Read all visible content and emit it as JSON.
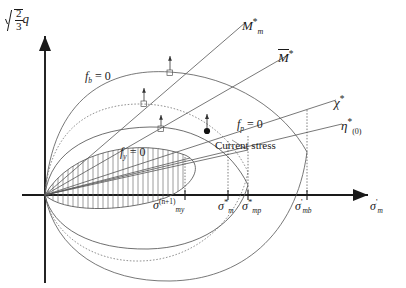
{
  "figure": {
    "axes": {
      "y_label_radicand_num": "2",
      "y_label_radicand_den": "3",
      "y_label_var": "q",
      "x_label_var": "σ",
      "x_label_prime": "'",
      "x_label_sub": "m"
    },
    "curve_labels": [
      {
        "id": "fb",
        "var": "f",
        "sub": "b",
        "eq": " = 0"
      },
      {
        "id": "fp",
        "var": "f",
        "sub": "p",
        "eq": " = 0"
      },
      {
        "id": "fy",
        "var": "f",
        "sub": "y",
        "eq": " = 0"
      }
    ],
    "line_labels": [
      {
        "id": "Mm",
        "var": "M",
        "sub": "m",
        "star": "*",
        "bar": false
      },
      {
        "id": "Mbar",
        "var": "M",
        "sub": "",
        "star": "*",
        "bar": true
      },
      {
        "id": "chi",
        "var": "χ",
        "sub": "",
        "star": "*",
        "bar": false
      },
      {
        "id": "eta",
        "var": "η",
        "sub": "(0)",
        "star": "*",
        "bar": false
      }
    ],
    "annotation": {
      "current_stress": "Current stress"
    },
    "x_ticks": [
      {
        "id": "smy",
        "var": "σ",
        "sup": "(n+1)",
        "sub": "my",
        "star": "",
        "prime": ""
      },
      {
        "id": "smstar",
        "var": "σ",
        "sup": "",
        "sub": "m",
        "star": "*",
        "prime": ""
      },
      {
        "id": "smp",
        "var": "σ",
        "sup": "",
        "sub": "mp",
        "star": "*",
        "prime": ""
      },
      {
        "id": "smb",
        "var": "σ",
        "sup": "",
        "sub": "mb",
        "star": "",
        "prime": "'"
      }
    ],
    "colors": {
      "ink": "#1a1a1a",
      "curve": "#555555",
      "dotted": "#777777",
      "hatch": "#666666"
    }
  }
}
